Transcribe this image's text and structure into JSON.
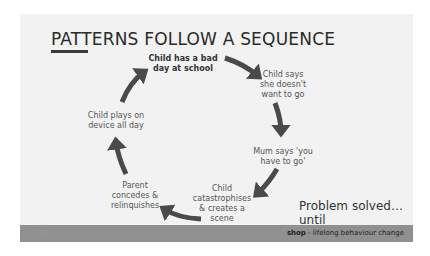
{
  "slide": {
    "title": "PATTERNS FOLLOW A SEQUENCE",
    "cycle": [
      {
        "id": "bad-day",
        "lines": [
          "Child has a bad",
          "day at school"
        ],
        "bold": true
      },
      {
        "id": "doesnt-want",
        "lines": [
          "Child says",
          "she doesn't",
          "want to go"
        ]
      },
      {
        "id": "mum-says",
        "lines": [
          "Mum says 'you",
          "have to go'"
        ]
      },
      {
        "id": "catastrophises",
        "lines": [
          "Child",
          "catastrophises",
          "& creates a",
          "scene"
        ]
      },
      {
        "id": "parent-concedes",
        "lines": [
          "Parent",
          "concedes &",
          "relinquishes"
        ]
      },
      {
        "id": "plays-device",
        "lines": [
          "Child plays on",
          "device all day"
        ]
      }
    ],
    "punchline": [
      "Problem solved…until",
      "next time!"
    ],
    "footer": {
      "page_number": "24",
      "brand_bold": "shop",
      "brand_rest": " - lifelong behaviour change"
    }
  },
  "colors": {
    "slide_bg": "#f2f2f2",
    "arrow": "#4a4a4a",
    "footer_bg": "#909090"
  }
}
